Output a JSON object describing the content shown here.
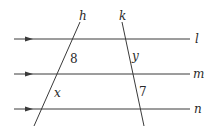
{
  "diagram": {
    "type": "parallel-lines-with-transversals",
    "colors": {
      "line": "#3a3a3a",
      "text": "#2a2a2a",
      "background": "#ffffff"
    },
    "parallel_lines": [
      {
        "name": "l",
        "label": "l",
        "y": 39,
        "x1": 14,
        "x2": 190,
        "arrow": true
      },
      {
        "name": "m",
        "label": "m",
        "y": 74,
        "x1": 14,
        "x2": 190,
        "arrow": true
      },
      {
        "name": "n",
        "label": "n",
        "y": 109,
        "x1": 14,
        "x2": 190,
        "arrow": true
      }
    ],
    "transversals": [
      {
        "name": "h",
        "label": "h",
        "x1": 34,
        "y1": 126,
        "x2": 80,
        "y2": 22
      },
      {
        "name": "k",
        "label": "k",
        "x1": 122,
        "y1": 22,
        "x2": 144,
        "y2": 126
      }
    ],
    "segment_labels": [
      {
        "name": "h-segment-lm",
        "text": "8",
        "x": 70,
        "y": 63,
        "italic": false
      },
      {
        "name": "h-segment-mn",
        "text": "x",
        "x": 54,
        "y": 97,
        "italic": true
      },
      {
        "name": "k-segment-lm",
        "text": "y",
        "x": 132,
        "y": 60,
        "italic": true
      },
      {
        "name": "k-segment-mn",
        "text": "7",
        "x": 139,
        "y": 96,
        "italic": false
      }
    ],
    "line_labels": {
      "l": "l",
      "m": "m",
      "n": "n",
      "h": "h",
      "k": "k"
    }
  }
}
